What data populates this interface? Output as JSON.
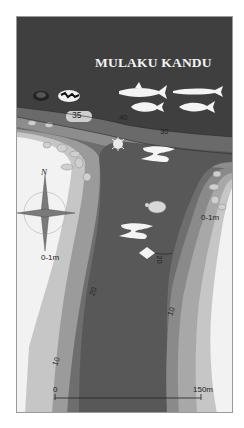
{
  "map": {
    "title": "MULAKU KANDU",
    "shallow_labels": [
      "0-1m",
      "0-1m"
    ],
    "depth_contours": [
      "40",
      "30",
      "20",
      "20",
      "10",
      "10"
    ],
    "depth_marker": "35",
    "scale": {
      "start": "0",
      "end": "150m"
    },
    "compass": {
      "north": "N"
    },
    "marine_life_icons": [
      "coral-icon",
      "coral-icon",
      "shark-icon",
      "barracuda-icon",
      "tuna-icon",
      "tuna-icon",
      "lionfish-icon",
      "manta-ray-icon",
      "turtle-icon",
      "manta-ray-icon",
      "stingray-icon"
    ],
    "colors": {
      "deep_water": "#3f3f3f",
      "band_40": "#6a6a6a",
      "band_30": "#8d8d8d",
      "band_20": "#6e6e6e",
      "band_10": "#9b9b9b",
      "band_5": "#c6c6c6",
      "reef_flat": "#f2f2f2"
    }
  }
}
